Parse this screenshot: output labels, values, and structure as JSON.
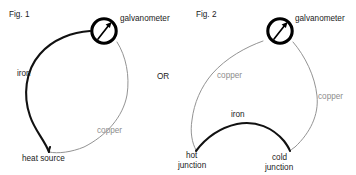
{
  "canvas": {
    "width": 356,
    "height": 175,
    "background": "#ffffff"
  },
  "palette": {
    "iron_wire": "#111111",
    "copper_wire": "#8d8d8d",
    "copper_label": "#8d8d8d",
    "text": "#1b1b1b",
    "galvanometer_ring": "#000000",
    "background": "#ffffff"
  },
  "separator": {
    "label": "OR"
  },
  "figures": [
    {
      "id": "fig-1",
      "caption": "Fig. 1",
      "description": "Thermocouple loop: a single iron wire and a single copper wire joined at a heat source form a closed teardrop loop through a galvanometer.",
      "instrument": {
        "name": "galvanometer",
        "label": "galvanometer",
        "icon": "galvanometer-dial-icon",
        "needle_direction": "up-right"
      },
      "wires": [
        {
          "material": "iron",
          "label": "iron",
          "color": "#111111",
          "style": "thick-black"
        },
        {
          "material": "copper",
          "label": "copper",
          "color": "#8d8d8d",
          "style": "thin-gray"
        }
      ],
      "nodes": [
        {
          "id": "heat-source",
          "label": "heat source"
        }
      ]
    },
    {
      "id": "fig-2",
      "caption": "Fig. 2",
      "description": "Thermocouple circuit: two copper leads run from the galvanometer to a hot junction and a cold junction, which are bridged by an iron wire.",
      "instrument": {
        "name": "galvanometer",
        "label": "galvanometer",
        "icon": "galvanometer-dial-icon",
        "needle_direction": "up-right"
      },
      "wires": [
        {
          "material": "copper",
          "label": "copper",
          "color": "#8d8d8d",
          "style": "thin-gray",
          "side": "left"
        },
        {
          "material": "copper",
          "label": "copper",
          "color": "#8d8d8d",
          "style": "thin-gray",
          "side": "right"
        },
        {
          "material": "iron",
          "label": "iron",
          "color": "#111111",
          "style": "thick-black",
          "side": "bottom"
        }
      ],
      "nodes": [
        {
          "id": "hot-junction",
          "label_line1": "hot",
          "label_line2": "junction"
        },
        {
          "id": "cold-junction",
          "label_line1": "cold",
          "label_line2": "junction"
        }
      ]
    }
  ]
}
